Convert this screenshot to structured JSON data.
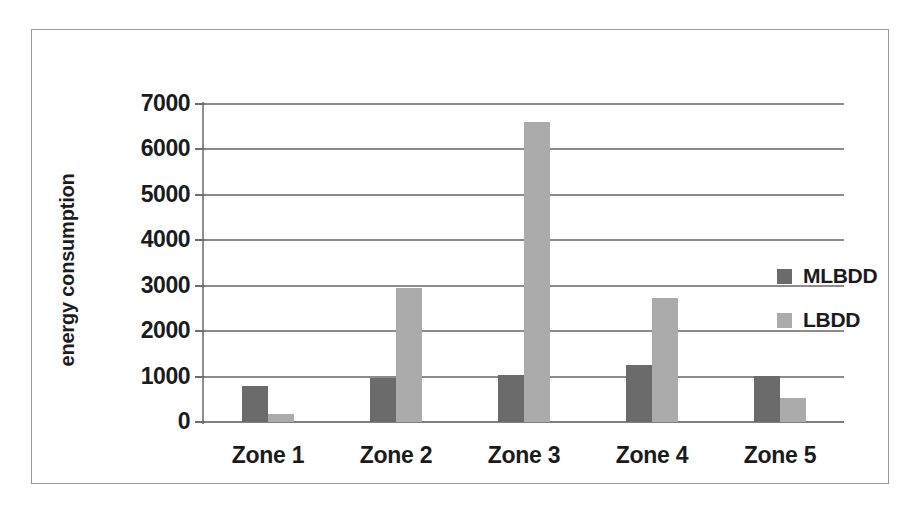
{
  "chart_data": {
    "type": "bar",
    "title": "",
    "xlabel": "",
    "ylabel": "energy consumption",
    "categories": [
      "Zone 1",
      "Zone 2",
      "Zone 3",
      "Zone 4",
      "Zone 5"
    ],
    "series": [
      {
        "name": "MLBDD",
        "color": "#6b6b6b",
        "values": [
          800,
          970,
          1030,
          1260,
          1010
        ]
      },
      {
        "name": "LBDD",
        "color": "#ababab",
        "values": [
          170,
          2940,
          6600,
          2740,
          530
        ]
      }
    ],
    "ylim": [
      0,
      7000
    ],
    "yticks": [
      0,
      1000,
      2000,
      3000,
      4000,
      5000,
      6000,
      7000
    ],
    "ytick_labels": [
      "0",
      "1000",
      "2000",
      "3000",
      "4000",
      "5000",
      "6000",
      "7000"
    ],
    "grid": true,
    "legend_position": "right-middle",
    "legend_entries": [
      "MLBDD",
      "LBDD"
    ],
    "grid_color": "#8c8c8c",
    "border_color": "#9a9a9a",
    "text_color": "#1b1b1b",
    "background": "#ffffff"
  }
}
